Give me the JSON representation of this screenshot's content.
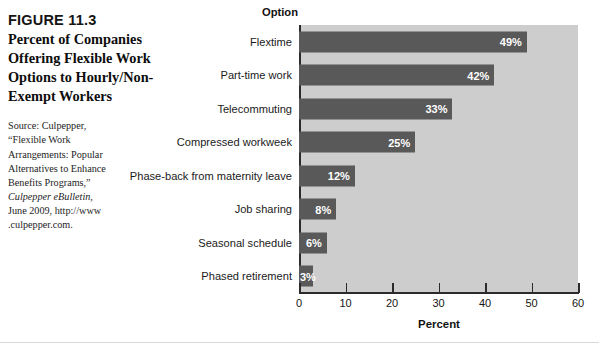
{
  "caption": {
    "figure_number": "FIGURE 11.3",
    "title": "Percent of Companies Offering Flexible Work Options to Hourly/Non-Exempt Workers",
    "source_lines": [
      "Source: Culpepper,",
      "“Flexible Work",
      "Arrangements: Popular",
      "Alternatives to Enhance",
      "Benefits Programs,”"
    ],
    "source_italic": "Culpepper eBulletin,",
    "source_tail": "June 2009, http://www .culpepper.com."
  },
  "chart_data": {
    "type": "bar",
    "orientation": "horizontal",
    "title": "",
    "xlabel": "Percent",
    "ylabel": "Option",
    "xlim": [
      0,
      60
    ],
    "xticks": [
      0,
      10,
      20,
      30,
      40,
      50,
      60
    ],
    "grid": false,
    "legend": false,
    "categories": [
      "Flextime",
      "Part-time work",
      "Telecommuting",
      "Compressed workweek",
      "Phase-back from maternity leave",
      "Job sharing",
      "Seasonal schedule",
      "Phased retirement"
    ],
    "values": [
      49,
      42,
      33,
      25,
      12,
      8,
      6,
      3
    ],
    "data_labels": [
      "49%",
      "42%",
      "33%",
      "25%",
      "12%",
      "8%",
      "6%",
      "3%"
    ],
    "bar_color": "#595959",
    "plot_background": "#cdcdcd",
    "label_color": "#ffffff"
  }
}
